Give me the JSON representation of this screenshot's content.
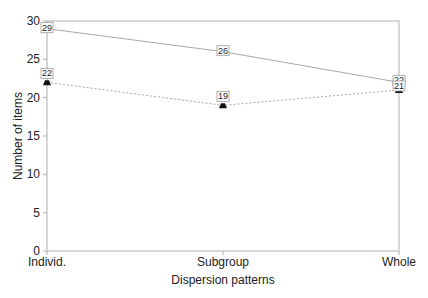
{
  "chart_data": {
    "type": "line",
    "title": "",
    "xlabel": "Dispersion patterns",
    "ylabel": "Number of items",
    "categories": [
      "Individ.",
      "Subgroup",
      "Whole"
    ],
    "ylim": [
      0,
      30
    ],
    "yticks": [
      0,
      5,
      10,
      15,
      20,
      25,
      30
    ],
    "grid": false,
    "legend": null,
    "series": [
      {
        "name": "Series 1",
        "values": [
          29,
          26,
          22
        ],
        "line_style": "solid",
        "marker": "none",
        "data_labels": [
          "29",
          "26",
          "22"
        ]
      },
      {
        "name": "Series 2",
        "values": [
          22,
          19,
          21
        ],
        "line_style": "dotted",
        "marker": "triangle",
        "data_labels": [
          "22",
          "19",
          "21"
        ]
      }
    ],
    "colors": {
      "line": "#a8a8a8",
      "axis": "#b0b0b0",
      "marker": "#111111",
      "text": "#222222"
    }
  }
}
